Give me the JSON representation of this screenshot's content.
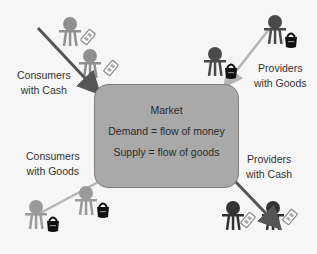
{
  "market": {
    "title": "Market",
    "demand": "Demand = flow of money",
    "supply": "Supply = flow of goods",
    "fill": "#a9a9a9"
  },
  "groups": {
    "consumers_cash": {
      "line1": "Consumers",
      "line2": "with Cash",
      "figure_color": "#8f8f8f",
      "item": "cash-icon"
    },
    "providers_goods": {
      "line1": "Providers",
      "line2": "with Goods",
      "figure_color": "#4a4a4a",
      "item": "goods-bag-icon"
    },
    "consumers_goods": {
      "line1": "Consumers",
      "line2": "with Goods",
      "figure_color": "#9a9a9a",
      "item": "goods-bag-icon"
    },
    "providers_cash": {
      "line1": "Providers",
      "line2": "with Cash",
      "figure_color": "#333333",
      "item": "cash-icon"
    }
  },
  "colors": {
    "background": "#f6f6f6",
    "dark_arrow": "#555555",
    "light_arrow": "#b5b5b5",
    "bag": "#111111"
  }
}
